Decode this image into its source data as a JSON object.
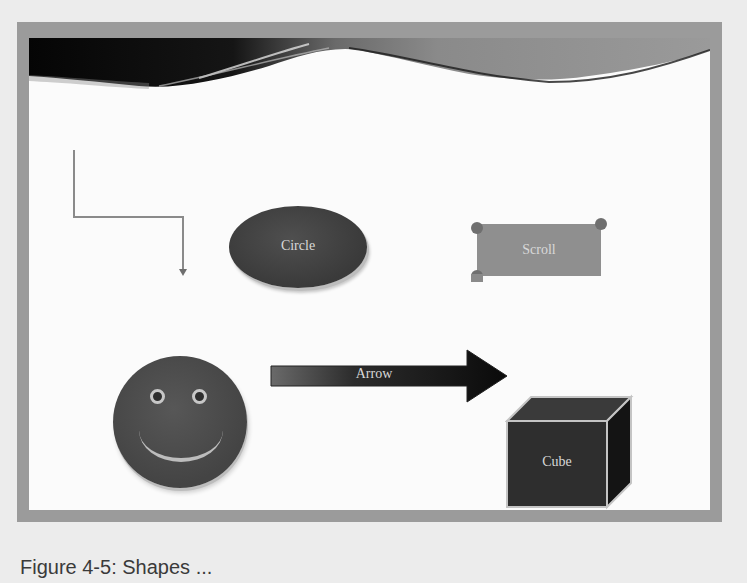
{
  "slide": {
    "shapes": {
      "connector": {
        "type": "elbow-connector-arrow",
        "color": "#8a8a8a"
      },
      "ellipse": {
        "label": "Circle",
        "fill": "#444444"
      },
      "scroll": {
        "label": "Scroll",
        "fill": "#8f8f8f"
      },
      "smiley": {
        "type": "smiley-face",
        "fill": "#4a4a4a"
      },
      "arrow": {
        "label": "Arrow",
        "fill": "#1a1a1a"
      },
      "cube": {
        "label": "Cube",
        "fill": "#2c2c2c"
      }
    },
    "colors": {
      "frame": "#9b9b9b",
      "slide_background": "#fbfbfb",
      "banner_dark": "#0d0d0d",
      "page_background": "#ececec"
    }
  },
  "caption": {
    "text": "Figure 4-5: Shapes ..."
  }
}
